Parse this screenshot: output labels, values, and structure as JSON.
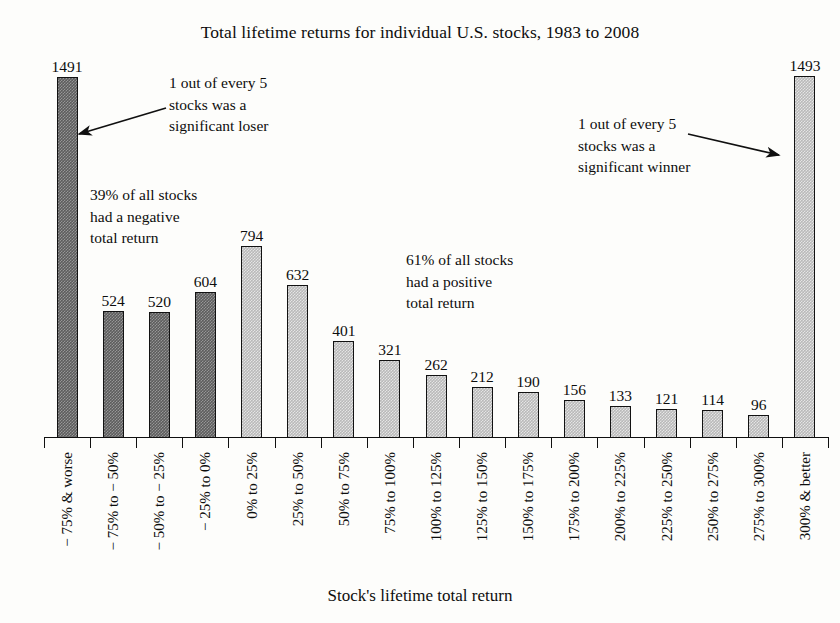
{
  "chart_data": {
    "type": "bar",
    "title": "Total lifetime returns for individual U.S. stocks, 1983 to 2008",
    "xlabel": "Stock's lifetime total return",
    "ylabel": "",
    "ylim": [
      0,
      1560
    ],
    "grid": false,
    "legend": "none",
    "categories": [
      "− 75% & worse",
      "− 75% to − 50%",
      "− 50% to − 25%",
      "− 25% to 0%",
      "0% to 25%",
      "25% to 50%",
      "50% to 75%",
      "75% to 100%",
      "100% to 125%",
      "125% to 150%",
      "150% to 175%",
      "175% to 200%",
      "200% to 225%",
      "225% to 250%",
      "250% to 275%",
      "275% to 300%",
      "300% & better"
    ],
    "values": [
      1491,
      524,
      520,
      604,
      794,
      632,
      401,
      321,
      262,
      212,
      190,
      156,
      133,
      121,
      114,
      96,
      1493
    ],
    "series_group": [
      "negative",
      "negative",
      "negative",
      "negative",
      "positive",
      "positive",
      "positive",
      "positive",
      "positive",
      "positive",
      "positive",
      "positive",
      "positive",
      "positive",
      "positive",
      "positive",
      "positive"
    ],
    "annotations": [
      "1 out of every 5 stocks was a significant loser",
      "39% of all stocks had a negative total return",
      "61% of all stocks had a positive total return",
      "1 out of every 5 stocks was a significant winner"
    ],
    "colors": {
      "negative_bar": "#5d5d5d",
      "positive_bar": "#b9b9b9",
      "bar_outline": "#121212",
      "text": "#0d0d0d",
      "background": "#fdfdfb"
    }
  },
  "title": {
    "text": "Total lifetime returns for individual U.S. stocks, 1983 to 2008"
  },
  "axis": {
    "x_title": "Stock's lifetime total return"
  },
  "annotations": {
    "loser": {
      "line1": "1 out of every 5",
      "line2": "stocks was a",
      "line3": "significant loser"
    },
    "negative": {
      "line1": "39% of all stocks",
      "line2": "had a negative",
      "line3": "total return"
    },
    "positive": {
      "line1": "61% of all stocks",
      "line2": "had a positive",
      "line3": "total return"
    },
    "winner": {
      "line1": "1 out of every 5",
      "line2": "stocks was a",
      "line3": "significant winner"
    }
  }
}
